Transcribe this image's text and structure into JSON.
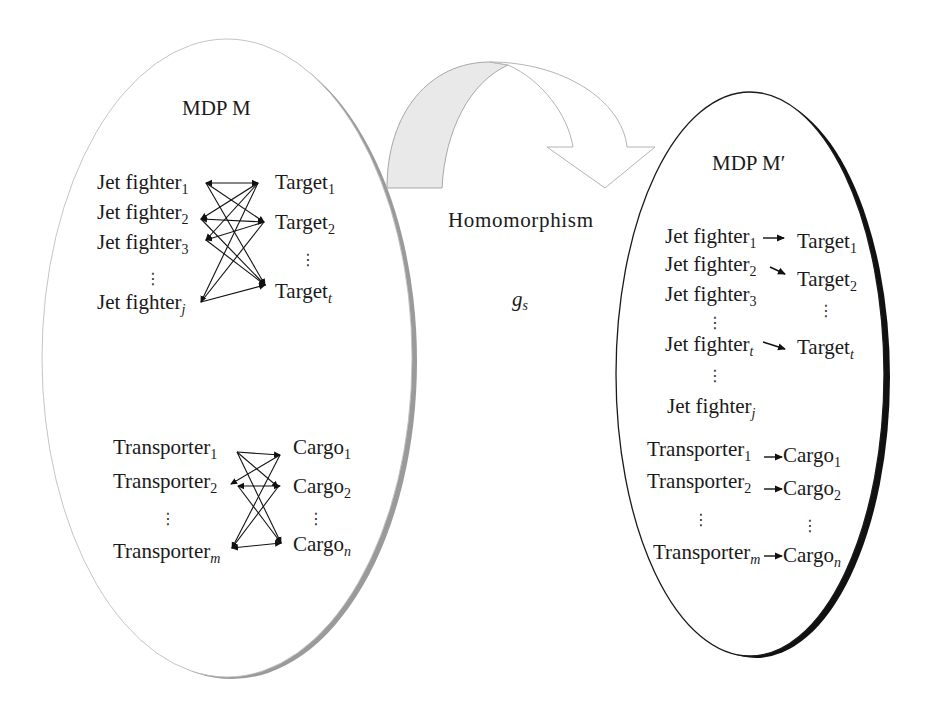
{
  "ellipsis": "⋮",
  "left_mdp": {
    "title": "MDP M",
    "jet_fighters": [
      {
        "name": "Jet fighter",
        "sub": "1"
      },
      {
        "name": "Jet fighter",
        "sub": "2"
      },
      {
        "name": "Jet fighter",
        "sub": "3"
      },
      {
        "name": "Jet fighter",
        "sub": "j"
      }
    ],
    "targets": [
      {
        "name": "Target",
        "sub": "1"
      },
      {
        "name": "Target",
        "sub": "2"
      },
      {
        "name": "Target",
        "sub": "t"
      }
    ],
    "transporters": [
      {
        "name": "Transporter",
        "sub": "1"
      },
      {
        "name": "Transporter",
        "sub": "2"
      },
      {
        "name": "Transporter",
        "sub": "m"
      }
    ],
    "cargos": [
      {
        "name": "Cargo",
        "sub": "1"
      },
      {
        "name": "Cargo",
        "sub": "2"
      },
      {
        "name": "Cargo",
        "sub": "n"
      }
    ],
    "edges": "complete bipartite (all jet fighters ↔ all targets, all transporters ↔ all cargos)"
  },
  "transform": {
    "label": "Homomorphism",
    "symbol": "g",
    "symbol_sub": "s"
  },
  "right_mdp": {
    "title": "MDP M′",
    "jet_fighters": [
      {
        "name": "Jet fighter",
        "sub": "1"
      },
      {
        "name": "Jet fighter",
        "sub": "2"
      },
      {
        "name": "Jet fighter",
        "sub": "3"
      },
      {
        "name": "Jet fighter",
        "sub": "t"
      },
      {
        "name": "Jet fighter",
        "sub": "j"
      }
    ],
    "targets": [
      {
        "name": "Target",
        "sub": "1"
      },
      {
        "name": "Target",
        "sub": "2"
      },
      {
        "name": "Target",
        "sub": "t"
      }
    ],
    "transporters": [
      {
        "name": "Transporter",
        "sub": "1"
      },
      {
        "name": "Transporter",
        "sub": "2"
      },
      {
        "name": "Transporter",
        "sub": "m"
      }
    ],
    "cargos": [
      {
        "name": "Cargo",
        "sub": "1"
      },
      {
        "name": "Cargo",
        "sub": "2"
      },
      {
        "name": "Cargo",
        "sub": "n"
      }
    ],
    "mappings": [
      [
        "Jet fighter1",
        "Target1"
      ],
      [
        "Jet fighter2",
        "Target2"
      ],
      [
        "Jet fightert",
        "Targett"
      ],
      [
        "Transporter1",
        "Cargo1"
      ],
      [
        "Transporter2",
        "Cargo2"
      ],
      [
        "Transporterm",
        "Cargon"
      ]
    ]
  },
  "colors": {
    "left_shadow": "#9a9a9a",
    "right_shadow": "#111111",
    "arrow_fill": "#e9e9e9",
    "arrow_stroke": "#a8a8a8"
  }
}
